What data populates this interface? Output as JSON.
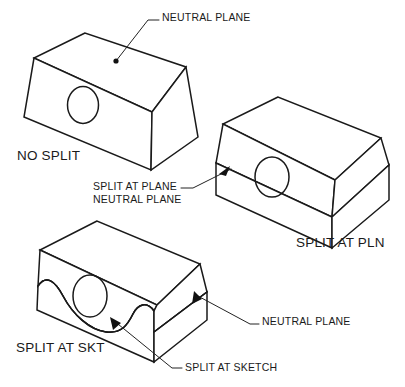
{
  "figure": {
    "title_present": false,
    "background_color": "#ffffff",
    "line_color": "#1a1a1a",
    "width": 405,
    "height": 387
  },
  "labels": {
    "neutral_plane_top": "NEUTRAL PLANE",
    "no_split": "NO SPLIT",
    "split_at_plane": "SPLIT AT PLANE",
    "neutral_plane_second_line": "NEUTRAL PLANE",
    "split_at_pln": "SPLIT AT PLN",
    "neutral_plane_right": "NEUTRAL PLANE",
    "split_at_skt": "SPLIT AT SKT",
    "split_at_sketch": "SPLIT AT SKETCH"
  },
  "shapes": [
    {
      "id": "shape-no-split",
      "caption": "NO SPLIT",
      "description": "tapered block solid, no split, with circular hole on front face",
      "annotation": "NEUTRAL PLANE",
      "annotation_marker": "dot",
      "split": "none"
    },
    {
      "id": "shape-split-at-plane",
      "caption": "SPLIT AT PLN",
      "description": "block split along neutral plane, upper and lower bodies",
      "annotation": "SPLIT AT PLANE NEUTRAL PLANE",
      "annotation_marker": "arrow",
      "split": "plane"
    },
    {
      "id": "shape-split-at-sketch",
      "caption": "SPLIT AT SKT",
      "description": "block split along a wavy sketch curve below the neutral plane",
      "annotation": "NEUTRAL PLANE / SPLIT AT SKETCH",
      "annotation_marker": "arrow",
      "split": "sketch"
    }
  ]
}
